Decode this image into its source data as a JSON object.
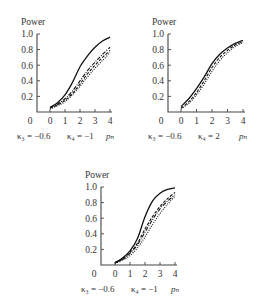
{
  "chart_data": [
    {
      "type": "line",
      "panel": "top-left",
      "ylabel": "Power",
      "xlabel": "p_n",
      "caption": {
        "k3": "κ₃ = −0.6",
        "k4": "κ₄ = −1",
        "xvar": "pₙ"
      },
      "xlim": [
        0,
        4
      ],
      "ylim": [
        0,
        1.0
      ],
      "xticks": [
        "0",
        "1",
        "2",
        "3",
        "4"
      ],
      "yticks": [
        "0.2",
        "0.4",
        "0.6",
        "0.8",
        "1.0"
      ],
      "origin_label": "0",
      "x": [
        0,
        0.5,
        1,
        1.5,
        2,
        2.5,
        3,
        3.5,
        4
      ],
      "series": [
        {
          "name": "solid",
          "style": "solid",
          "values": [
            0.06,
            0.12,
            0.22,
            0.38,
            0.58,
            0.72,
            0.83,
            0.91,
            0.96
          ]
        },
        {
          "name": "dash-dot",
          "style": "dashdot",
          "values": [
            0.05,
            0.1,
            0.17,
            0.27,
            0.4,
            0.53,
            0.64,
            0.74,
            0.83
          ]
        },
        {
          "name": "dashed",
          "style": "dashed",
          "values": [
            0.05,
            0.09,
            0.15,
            0.24,
            0.36,
            0.49,
            0.6,
            0.7,
            0.79
          ]
        },
        {
          "name": "dotted",
          "style": "dotted",
          "values": [
            0.04,
            0.08,
            0.13,
            0.22,
            0.33,
            0.45,
            0.56,
            0.66,
            0.76
          ]
        }
      ]
    },
    {
      "type": "line",
      "panel": "top-right",
      "ylabel": "Power",
      "xlabel": "p_n",
      "caption": {
        "k3": "κ₃ = −0.6",
        "k4": "κ₄ = 2",
        "xvar": "pₙ"
      },
      "xlim": [
        0,
        4
      ],
      "ylim": [
        0,
        1.0
      ],
      "xticks": [
        "0",
        "1",
        "2",
        "3",
        "4"
      ],
      "yticks": [
        "0.2",
        "0.4",
        "0.6",
        "0.8",
        "1.0"
      ],
      "origin_label": "0",
      "x": [
        0,
        0.5,
        1,
        1.5,
        2,
        2.5,
        3,
        3.5,
        4
      ],
      "series": [
        {
          "name": "solid",
          "style": "solid",
          "values": [
            0.07,
            0.17,
            0.3,
            0.45,
            0.62,
            0.74,
            0.82,
            0.88,
            0.92
          ]
        },
        {
          "name": "dashed",
          "style": "dashed",
          "values": [
            0.05,
            0.13,
            0.25,
            0.4,
            0.57,
            0.7,
            0.79,
            0.86,
            0.9
          ]
        },
        {
          "name": "dotted",
          "style": "dotted",
          "values": [
            0.04,
            0.11,
            0.22,
            0.36,
            0.52,
            0.66,
            0.76,
            0.84,
            0.89
          ]
        }
      ]
    },
    {
      "type": "line",
      "panel": "bottom-center",
      "ylabel": "Power",
      "xlabel": "p_n",
      "caption": {
        "k3": "κ₃ = −0.6",
        "k4": "κ₄ = −1",
        "xvar": "pₙ"
      },
      "xlim": [
        0,
        4
      ],
      "ylim": [
        0,
        1.0
      ],
      "xticks": [
        "0",
        "1",
        "2",
        "3",
        "4"
      ],
      "yticks": [
        "0.2",
        "0.4",
        "0.6",
        "0.8",
        "1.0"
      ],
      "origin_label": "0",
      "x": [
        0,
        0.5,
        1,
        1.5,
        2,
        2.5,
        3,
        3.5,
        4
      ],
      "series": [
        {
          "name": "solid",
          "style": "solid",
          "values": [
            0.03,
            0.09,
            0.18,
            0.34,
            0.62,
            0.82,
            0.92,
            0.97,
            0.99
          ]
        },
        {
          "name": "dashed-marked",
          "style": "dashed",
          "values": [
            0.03,
            0.08,
            0.16,
            0.28,
            0.46,
            0.62,
            0.75,
            0.85,
            0.93
          ]
        },
        {
          "name": "dash-dot",
          "style": "dashdot",
          "values": [
            0.03,
            0.07,
            0.15,
            0.26,
            0.42,
            0.58,
            0.72,
            0.82,
            0.9
          ]
        },
        {
          "name": "dotted",
          "style": "dotted",
          "values": [
            0.02,
            0.06,
            0.12,
            0.22,
            0.36,
            0.52,
            0.66,
            0.78,
            0.88
          ]
        }
      ]
    }
  ]
}
